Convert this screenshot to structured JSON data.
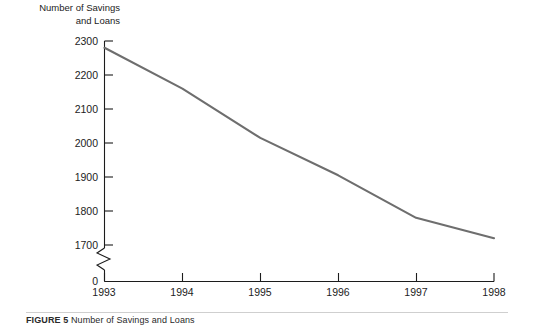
{
  "chart_data": {
    "type": "line",
    "title": "",
    "ylabel": "Number of Savings\nand Loans",
    "xlabel": "",
    "categories": [
      "1993",
      "1994",
      "1995",
      "1996",
      "1997",
      "1998"
    ],
    "x": [
      1993,
      1994,
      1995,
      1996,
      1997,
      1998
    ],
    "values": [
      2280,
      2160,
      2015,
      1905,
      1780,
      1720
    ],
    "series": [
      {
        "name": "Number of Savings and Loans",
        "values": [
          2280,
          2160,
          2015,
          1905,
          1780,
          1720
        ]
      }
    ],
    "ylim": [
      1650,
      2300
    ],
    "y_ticks": [
      2300,
      2200,
      2100,
      2000,
      1900,
      1800,
      1700
    ],
    "y_tick_labels": [
      "2300",
      "2200",
      "2100",
      "2000",
      "1900",
      "1800",
      "1700"
    ],
    "x_tick_labels": [
      "1993",
      "1994",
      "1995",
      "1996",
      "1997",
      "1998"
    ],
    "zero_label": "0",
    "axis_break": true,
    "grid": false,
    "legend": false,
    "line_color": "#6e6e6e",
    "axis_color": "#1c1c1c"
  },
  "caption": {
    "figure_number": "FIGURE 5",
    "text": "Number of Savings and Loans"
  }
}
